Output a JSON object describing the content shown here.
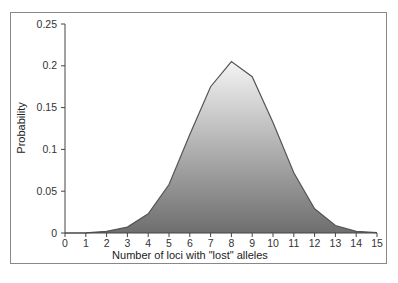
{
  "chart_data": {
    "type": "area",
    "title": "",
    "xlabel": "Number of loci with \"lost\" alleles",
    "ylabel": "Probability",
    "x": [
      0,
      1,
      2,
      3,
      4,
      5,
      6,
      7,
      8,
      9,
      10,
      11,
      12,
      13,
      14,
      15
    ],
    "values": [
      0,
      0.0002,
      0.002,
      0.007,
      0.023,
      0.058,
      0.118,
      0.175,
      0.205,
      0.187,
      0.132,
      0.072,
      0.029,
      0.009,
      0.002,
      0.0003
    ],
    "xlim": [
      0,
      15
    ],
    "ylim": [
      0,
      0.25
    ],
    "x_ticks": [
      "0",
      "1",
      "2",
      "3",
      "4",
      "5",
      "6",
      "7",
      "8",
      "9",
      "10",
      "11",
      "12",
      "13",
      "14",
      "15"
    ],
    "y_ticks": [
      "0",
      "0.05",
      "0.1",
      "0.15",
      "0.2",
      "0.25"
    ],
    "grid": false,
    "legend": null,
    "fill": "gradient white-to-dark-gray"
  }
}
